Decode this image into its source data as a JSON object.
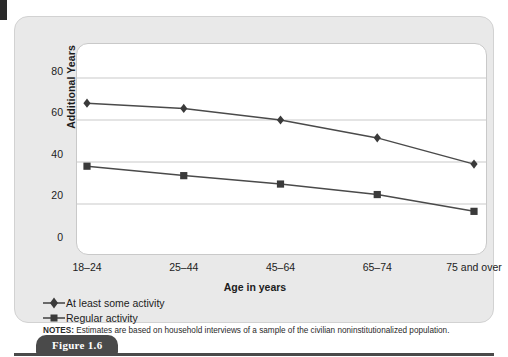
{
  "figure": {
    "caption": "Figure 1.6"
  },
  "notes": {
    "label": "NOTES:",
    "text": " Estimates are based on household interviews of a sample of the civilian noninstitutionalized population."
  },
  "colors": {
    "panel_background": "#e9e9e9",
    "plot_background": "#ffffff",
    "gridline": "#c9c9c9",
    "series_line": "#4a4a4a",
    "marker": "#3a3a3a",
    "text": "#1c1c1c",
    "caption_tab": "#4a4a4a"
  },
  "chart_data": {
    "type": "line",
    "title": "",
    "xlabel": "Age in years",
    "ylabel": "Additional Years",
    "categories": [
      "18–24",
      "25–44",
      "45–64",
      "65–74",
      "75 and over"
    ],
    "ylim": [
      0,
      90
    ],
    "yticks": [
      0,
      20,
      40,
      60,
      80
    ],
    "ytick_labels": [
      "0",
      "20",
      "40",
      "60",
      "80"
    ],
    "grid": true,
    "legend_position": "below-axis-left",
    "series": [
      {
        "name": "At least some activity",
        "marker": "diamond",
        "values": [
          68,
          65.5,
          60,
          51.5,
          39
        ]
      },
      {
        "name": "Regular activity",
        "marker": "square",
        "values": [
          38,
          33.5,
          29.5,
          24.5,
          16.5
        ]
      }
    ]
  }
}
